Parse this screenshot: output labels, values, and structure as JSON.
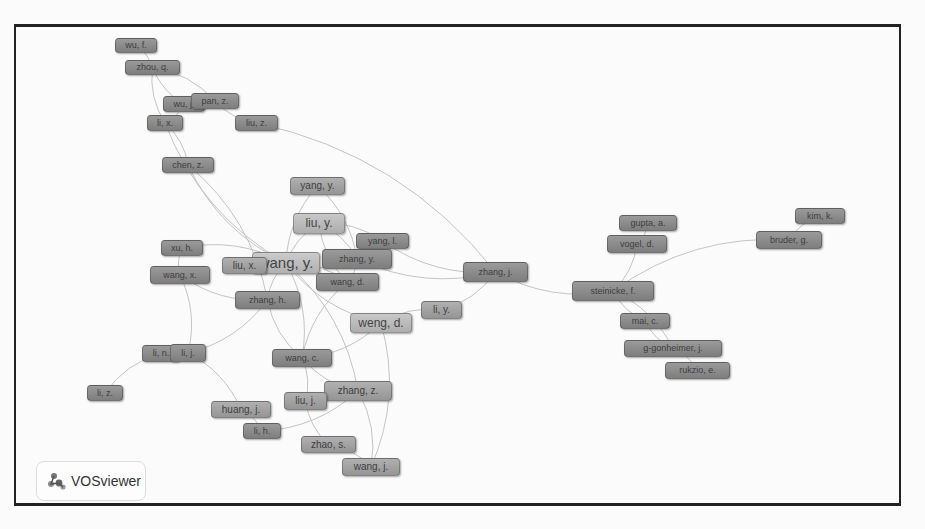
{
  "figure": {
    "type": "co-authorship network",
    "software_logo": "VOSviewer"
  },
  "nodes": [
    {
      "id": "wu_f",
      "label": "wu, f.",
      "x": 115,
      "y": 38,
      "w": 42,
      "h": 15,
      "size": "d"
    },
    {
      "id": "zhou_q",
      "label": "zhou, q.",
      "x": 125,
      "y": 60,
      "w": 55,
      "h": 15,
      "size": "d"
    },
    {
      "id": "wu_j",
      "label": "wu, j.",
      "x": 163,
      "y": 96,
      "w": 42,
      "h": 16,
      "size": "d"
    },
    {
      "id": "pan_z",
      "label": "pan, z.",
      "x": 191,
      "y": 93,
      "w": 48,
      "h": 16,
      "size": "d"
    },
    {
      "id": "li_x",
      "label": "li, x.",
      "x": 147,
      "y": 115,
      "w": 36,
      "h": 16,
      "size": "d"
    },
    {
      "id": "liu_z",
      "label": "liu, z.",
      "x": 235,
      "y": 115,
      "w": 43,
      "h": 16,
      "size": "d"
    },
    {
      "id": "chen_z",
      "label": "chen, z.",
      "x": 162,
      "y": 157,
      "w": 52,
      "h": 16,
      "size": "d"
    },
    {
      "id": "yang_y",
      "label": "yang, y.",
      "x": 290,
      "y": 177,
      "w": 55,
      "h": 18,
      "size": "m"
    },
    {
      "id": "liu_y",
      "label": "liu, y.",
      "x": 293,
      "y": 213,
      "w": 52,
      "h": 21,
      "size": "l"
    },
    {
      "id": "yang_l",
      "label": "yang, l.",
      "x": 356,
      "y": 233,
      "w": 53,
      "h": 16,
      "size": "d"
    },
    {
      "id": "xu_h",
      "label": "xu, h.",
      "x": 161,
      "y": 240,
      "w": 42,
      "h": 16,
      "size": "d"
    },
    {
      "id": "zhang_y",
      "label": "zhang, y.",
      "x": 322,
      "y": 249,
      "w": 70,
      "h": 20,
      "size": "d"
    },
    {
      "id": "wang_y",
      "label": "wang, y.",
      "x": 252,
      "y": 252,
      "w": 68,
      "h": 22,
      "size": "xl"
    },
    {
      "id": "liu_x",
      "label": "liu, x.",
      "x": 222,
      "y": 257,
      "w": 45,
      "h": 17,
      "size": "m"
    },
    {
      "id": "wang_x",
      "label": "wang, x.",
      "x": 150,
      "y": 266,
      "w": 60,
      "h": 18,
      "size": "d"
    },
    {
      "id": "wang_d",
      "label": "wang, d.",
      "x": 316,
      "y": 273,
      "w": 63,
      "h": 18,
      "size": "d"
    },
    {
      "id": "zhang_j",
      "label": "zhang, j.",
      "x": 463,
      "y": 262,
      "w": 65,
      "h": 20,
      "size": "d"
    },
    {
      "id": "zhang_h",
      "label": "zhang, h.",
      "x": 235,
      "y": 291,
      "w": 65,
      "h": 18,
      "size": "d"
    },
    {
      "id": "li_y",
      "label": "li, y.",
      "x": 421,
      "y": 301,
      "w": 41,
      "h": 18,
      "size": "m"
    },
    {
      "id": "weng_d",
      "label": "weng, d.",
      "x": 350,
      "y": 313,
      "w": 62,
      "h": 20,
      "size": "l"
    },
    {
      "id": "li_n",
      "label": "li, n.",
      "x": 142,
      "y": 345,
      "w": 38,
      "h": 17,
      "size": "d"
    },
    {
      "id": "li_j",
      "label": "li, j.",
      "x": 170,
      "y": 344,
      "w": 36,
      "h": 18,
      "size": "d"
    },
    {
      "id": "wang_c",
      "label": "wang, c.",
      "x": 272,
      "y": 349,
      "w": 60,
      "h": 18,
      "size": "d"
    },
    {
      "id": "li_z",
      "label": "li, z.",
      "x": 87,
      "y": 385,
      "w": 36,
      "h": 16,
      "size": "d"
    },
    {
      "id": "zhang_z",
      "label": "zhang, z.",
      "x": 324,
      "y": 381,
      "w": 68,
      "h": 20,
      "size": "m"
    },
    {
      "id": "liu_j",
      "label": "liu, j.",
      "x": 284,
      "y": 392,
      "w": 43,
      "h": 18,
      "size": "m"
    },
    {
      "id": "huang_j",
      "label": "huang, j.",
      "x": 211,
      "y": 401,
      "w": 60,
      "h": 17,
      "size": "m"
    },
    {
      "id": "li_h",
      "label": "li, h.",
      "x": 243,
      "y": 423,
      "w": 38,
      "h": 16,
      "size": "d"
    },
    {
      "id": "zhao_s",
      "label": "zhao, s.",
      "x": 301,
      "y": 436,
      "w": 55,
      "h": 17,
      "size": "m"
    },
    {
      "id": "wang_j",
      "label": "wang, j.",
      "x": 342,
      "y": 458,
      "w": 58,
      "h": 18,
      "size": "m"
    },
    {
      "id": "gupta_a",
      "label": "gupta, a.",
      "x": 619,
      "y": 215,
      "w": 58,
      "h": 16,
      "size": "d"
    },
    {
      "id": "vogel_d",
      "label": "vogel, d.",
      "x": 607,
      "y": 235,
      "w": 60,
      "h": 18,
      "size": "d"
    },
    {
      "id": "kim_k",
      "label": "kim, k.",
      "x": 795,
      "y": 208,
      "w": 50,
      "h": 16,
      "size": "d"
    },
    {
      "id": "bruder_g",
      "label": "bruder, g.",
      "x": 756,
      "y": 231,
      "w": 66,
      "h": 18,
      "size": "d"
    },
    {
      "id": "steinicke_f",
      "label": "steinicke, f.",
      "x": 572,
      "y": 281,
      "w": 82,
      "h": 20,
      "size": "d"
    },
    {
      "id": "mai_c",
      "label": "mai, c.",
      "x": 620,
      "y": 313,
      "w": 50,
      "h": 16,
      "size": "d"
    },
    {
      "id": "g_gonheimer_j",
      "label": "g-gonheimer, j.",
      "x": 624,
      "y": 340,
      "w": 98,
      "h": 17,
      "size": "d"
    },
    {
      "id": "rukzio_e",
      "label": "rukzio, e.",
      "x": 665,
      "y": 362,
      "w": 65,
      "h": 17,
      "size": "d"
    }
  ],
  "edges": [
    [
      "wu_f",
      "zhou_q"
    ],
    [
      "zhou_q",
      "wu_j"
    ],
    [
      "zhou_q",
      "pan_z"
    ],
    [
      "zhou_q",
      "li_x"
    ],
    [
      "wu_j",
      "li_x"
    ],
    [
      "pan_z",
      "liu_z"
    ],
    [
      "li_x",
      "chen_z"
    ],
    [
      "li_x",
      "wang_y"
    ],
    [
      "liu_z",
      "zhang_j"
    ],
    [
      "chen_z",
      "wang_y"
    ],
    [
      "chen_z",
      "zhang_h"
    ],
    [
      "yang_y",
      "wang_y"
    ],
    [
      "yang_y",
      "zhang_y"
    ],
    [
      "liu_y",
      "wang_y"
    ],
    [
      "liu_y",
      "zhang_y"
    ],
    [
      "liu_y",
      "wang_d"
    ],
    [
      "liu_y",
      "yang_l"
    ],
    [
      "xu_h",
      "wang_x"
    ],
    [
      "xu_h",
      "wang_y"
    ],
    [
      "wang_x",
      "zhang_h"
    ],
    [
      "wang_x",
      "li_j"
    ],
    [
      "wang_y",
      "zhang_h"
    ],
    [
      "wang_y",
      "wang_c"
    ],
    [
      "wang_y",
      "zhang_y"
    ],
    [
      "wang_y",
      "wang_d"
    ],
    [
      "wang_y",
      "weng_d"
    ],
    [
      "wang_y",
      "zhang_z"
    ],
    [
      "zhang_y",
      "zhang_j"
    ],
    [
      "zhang_y",
      "wang_d"
    ],
    [
      "yang_l",
      "zhang_j"
    ],
    [
      "zhang_j",
      "li_y"
    ],
    [
      "zhang_j",
      "steinicke_f"
    ],
    [
      "zhang_h",
      "li_j"
    ],
    [
      "zhang_h",
      "wang_c"
    ],
    [
      "li_n",
      "li_j"
    ],
    [
      "li_n",
      "li_z"
    ],
    [
      "li_j",
      "huang_j"
    ],
    [
      "wang_c",
      "zhang_z"
    ],
    [
      "wang_c",
      "liu_j"
    ],
    [
      "wang_c",
      "weng_d"
    ],
    [
      "weng_d",
      "li_y"
    ],
    [
      "zhang_z",
      "liu_j"
    ],
    [
      "zhang_z",
      "wang_j"
    ],
    [
      "liu_j",
      "zhao_s"
    ],
    [
      "huang_j",
      "li_h"
    ],
    [
      "li_h",
      "zhang_z"
    ],
    [
      "zhao_s",
      "wang_j"
    ],
    [
      "wang_d",
      "wang_c"
    ],
    [
      "weng_d",
      "wang_j"
    ],
    [
      "steinicke_f",
      "vogel_d"
    ],
    [
      "steinicke_f",
      "bruder_g"
    ],
    [
      "steinicke_f",
      "mai_c"
    ],
    [
      "steinicke_f",
      "g_gonheimer_j"
    ],
    [
      "vogel_d",
      "gupta_a"
    ],
    [
      "bruder_g",
      "kim_k"
    ],
    [
      "mai_c",
      "g_gonheimer_j"
    ],
    [
      "g_gonheimer_j",
      "rukzio_e"
    ]
  ],
  "colors": {
    "frame_border": "#222222",
    "edge": "#c4c4c4",
    "node_dark": "#8a8a8a",
    "node_light": "#bdbdbd"
  }
}
